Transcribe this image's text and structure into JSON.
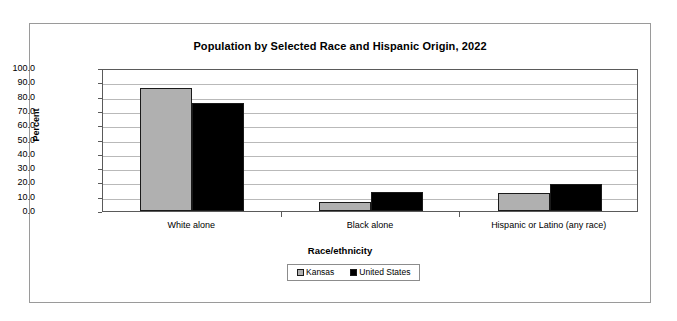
{
  "chart_data": {
    "type": "bar",
    "title": "Population by Selected Race and Hispanic Origin, 2022",
    "xlabel": "Race/ethnicity",
    "ylabel": "Percent",
    "ylim": [
      0,
      100
    ],
    "ytick_labels": [
      "100.0",
      "90.0",
      "80.0",
      "70.0",
      "60.0",
      "50.0",
      "40.0",
      "30.0",
      "20.0",
      "10.0",
      "0.0"
    ],
    "ytick_values": [
      100,
      90,
      80,
      70,
      60,
      50,
      40,
      30,
      20,
      10,
      0
    ],
    "grid": true,
    "legend_position": "bottom",
    "categories": [
      "White alone",
      "Black alone",
      "Hispanic or Latino (any race)"
    ],
    "series": [
      {
        "name": "Kansas",
        "color": "#b0b0b0",
        "values": [
          86.0,
          6.3,
          12.8
        ]
      },
      {
        "name": "United States",
        "color": "#000000",
        "values": [
          75.8,
          13.6,
          19.1
        ]
      }
    ]
  },
  "legend": {
    "items": [
      {
        "label": "Kansas"
      },
      {
        "label": "United States"
      }
    ]
  }
}
